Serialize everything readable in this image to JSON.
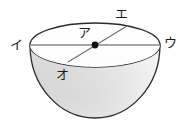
{
  "figure": {
    "kind": "geometry-diagram",
    "shape_name": "hemisphere",
    "background_color": "#ffffff",
    "outline_color": "#2b2b2b",
    "fill_light": "#fbfbfb",
    "fill_mid": "#e3e3e3",
    "fill_dark": "#cfcfcf",
    "rim_line_color": "#8c8c8c",
    "chord_line_color": "#6e6e6e",
    "center_dot_color": "#111111",
    "labels": [
      {
        "id": "a",
        "text": "ア",
        "role": "center-point",
        "x": 84,
        "y": 37
      },
      {
        "id": "i",
        "text": "イ",
        "role": "left-rim-point",
        "x": 16,
        "y": 49
      },
      {
        "id": "u",
        "text": "ウ",
        "role": "right-rim-point",
        "x": 167,
        "y": 47
      },
      {
        "id": "e",
        "text": "エ",
        "role": "back-rim-point",
        "x": 117,
        "y": 18
      },
      {
        "id": "o",
        "text": "オ",
        "role": "front-rim-point",
        "x": 62,
        "y": 77
      }
    ],
    "geometry": {
      "rim_ellipse": {
        "cx": 95,
        "cy": 45,
        "rx": 65,
        "ry": 22
      },
      "bowl_radius": 65,
      "bowl_bottom_y": 118,
      "center_dot": {
        "cx": 95,
        "cy": 45,
        "r": 3
      },
      "horizontal_chord": {
        "x1": 30,
        "y1": 45,
        "x2": 160,
        "y2": 45
      },
      "diagonal_chord": {
        "x1": 127,
        "y1": 26,
        "x2": 68,
        "y2": 62
      }
    }
  }
}
